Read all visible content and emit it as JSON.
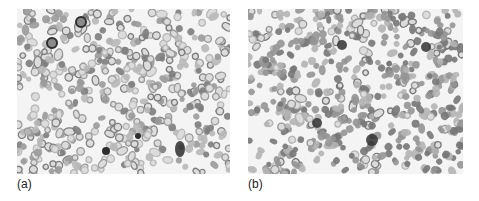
{
  "figure": {
    "panels": [
      {
        "id": "a",
        "label": "(a)",
        "description": "Grayscale micrograph of blood smear: dense red blood cells (many ring-shaped, central pallor) with a few dark nucleated leukocytes",
        "seed": 7,
        "cell_density": 520,
        "ring_fraction": 0.55,
        "dark_cells": [
          {
            "x": 64,
            "y": 13,
            "r": 5,
            "shape": "ring"
          },
          {
            "x": 35,
            "y": 34,
            "r": 5,
            "shape": "ring"
          },
          {
            "x": 89,
            "y": 142,
            "r": 4,
            "shape": "disc"
          },
          {
            "x": 163,
            "y": 140,
            "rx": 5,
            "ry": 8,
            "shape": "blob"
          },
          {
            "x": 121,
            "y": 127,
            "r": 3,
            "shape": "disc"
          }
        ],
        "colors": {
          "background": "#f4f4f4",
          "cell_light": "#b8b8b8",
          "cell_mid": "#9a9a9a",
          "cell_dark": "#7d7d7d",
          "nucleus": "#2e2e2e"
        }
      },
      {
        "id": "b",
        "label": "(b)",
        "description": "Grayscale micrograph of blood smear: dense, more solid (less central pallor) red blood cells with several dark nucleated leukocytes",
        "seed": 19,
        "cell_density": 560,
        "ring_fraction": 0.2,
        "dark_cells": [
          {
            "x": 94,
            "y": 36,
            "r": 5,
            "shape": "blob"
          },
          {
            "x": 178,
            "y": 38,
            "r": 5,
            "shape": "blob"
          },
          {
            "x": 69,
            "y": 114,
            "r": 5,
            "shape": "blob"
          },
          {
            "x": 124,
            "y": 131,
            "r": 6,
            "shape": "blob"
          }
        ],
        "colors": {
          "background": "#f4f4f4",
          "cell_light": "#b4b4b4",
          "cell_mid": "#959595",
          "cell_dark": "#777777",
          "nucleus": "#333333"
        }
      }
    ]
  }
}
